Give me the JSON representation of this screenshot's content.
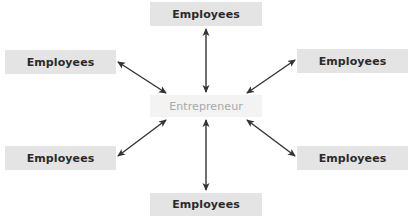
{
  "diagram": {
    "center": {
      "label": "Entrepreneur",
      "box": {
        "x": 150,
        "y": 95,
        "w": 112,
        "h": 22
      },
      "fill": "#f3f3f3",
      "text_color": "#a8a8a8"
    },
    "nodes": [
      {
        "id": "top",
        "label": "Employees",
        "box": {
          "x": 150,
          "y": 2,
          "w": 112,
          "h": 24
        }
      },
      {
        "id": "upper-left",
        "label": "Employees",
        "box": {
          "x": 5,
          "y": 50,
          "w": 111,
          "h": 24
        }
      },
      {
        "id": "upper-right",
        "label": "Employees",
        "box": {
          "x": 297,
          "y": 49,
          "w": 111,
          "h": 24
        }
      },
      {
        "id": "lower-left",
        "label": "Employees",
        "box": {
          "x": 5,
          "y": 146,
          "w": 111,
          "h": 24
        }
      },
      {
        "id": "lower-right",
        "label": "Employees",
        "box": {
          "x": 297,
          "y": 146,
          "w": 111,
          "h": 24
        }
      },
      {
        "id": "bottom",
        "label": "Employees",
        "box": {
          "x": 150,
          "y": 193,
          "w": 112,
          "h": 23
        }
      }
    ],
    "node_fill": "#e4e4e4",
    "node_text_color": "#2b2b2b",
    "arrow_color": "#333333",
    "edges": [
      {
        "from": "center",
        "to": "top",
        "type": "bidirectional"
      },
      {
        "from": "center",
        "to": "upper-left",
        "type": "bidirectional"
      },
      {
        "from": "center",
        "to": "upper-right",
        "type": "bidirectional"
      },
      {
        "from": "center",
        "to": "lower-left",
        "type": "bidirectional"
      },
      {
        "from": "center",
        "to": "lower-right",
        "type": "bidirectional"
      },
      {
        "from": "center",
        "to": "bottom",
        "type": "bidirectional"
      }
    ]
  }
}
